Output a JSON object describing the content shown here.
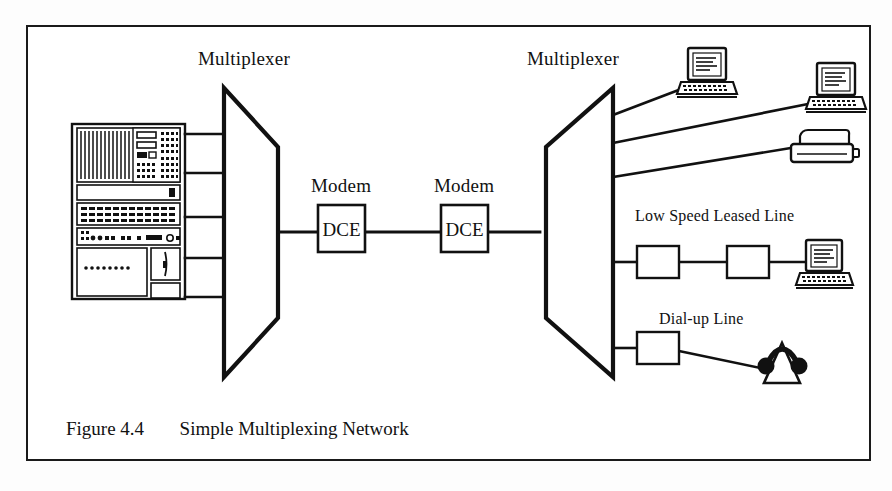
{
  "figure": {
    "caption_number": "Figure 4.4",
    "caption_title": "Simple Multiplexing Network",
    "frame_color": "#1a1a1a",
    "ink_color": "#111111",
    "background": "#ffffff"
  },
  "labels": {
    "multiplexer_left": "Multiplexer",
    "multiplexer_right": "Multiplexer",
    "modem_left": "Modem",
    "modem_right": "Modem",
    "leased_line": "Low Speed Leased Line",
    "dialup_line": "Dial-up Line"
  },
  "nodes": {
    "mainframe": {
      "name": "host-mainframe",
      "channel_count": 5
    },
    "mux_left": {
      "label": "Multiplexer",
      "inputs": 5,
      "outputs": 1
    },
    "mux_right": {
      "label": "Multiplexer",
      "inputs": 1,
      "outputs": 5
    },
    "modem_left": {
      "label": "Modem",
      "box_text": "DCE"
    },
    "modem_right": {
      "label": "Modem",
      "box_text": "DCE"
    },
    "terminal_top": {
      "type": "crt-terminal"
    },
    "terminal_second": {
      "type": "crt-terminal"
    },
    "printer": {
      "type": "printer"
    },
    "terminal_leased": {
      "type": "crt-terminal"
    },
    "acoustic_coupler": {
      "type": "acoustic-coupler"
    },
    "leased_modem_near": {
      "type": "modem-box",
      "box_text": ""
    },
    "leased_modem_far": {
      "type": "modem-box",
      "box_text": ""
    },
    "dialup_modem": {
      "type": "modem-box",
      "box_text": ""
    }
  },
  "links": [
    {
      "from": "mainframe",
      "to": "mux_left",
      "channel": 1
    },
    {
      "from": "mainframe",
      "to": "mux_left",
      "channel": 2
    },
    {
      "from": "mainframe",
      "to": "mux_left",
      "channel": 3
    },
    {
      "from": "mainframe",
      "to": "mux_left",
      "channel": 4
    },
    {
      "from": "mainframe",
      "to": "mux_left",
      "channel": 5
    },
    {
      "from": "mux_left",
      "to": "modem_left",
      "channel": 0
    },
    {
      "from": "modem_left",
      "to": "modem_right",
      "channel": 0
    },
    {
      "from": "modem_right",
      "to": "mux_right",
      "channel": 0
    },
    {
      "from": "mux_right",
      "to": "terminal_top",
      "channel": 1
    },
    {
      "from": "mux_right",
      "to": "terminal_second",
      "channel": 2
    },
    {
      "from": "mux_right",
      "to": "printer",
      "channel": 3
    },
    {
      "from": "mux_right",
      "to": "leased_modem_near",
      "channel": 4
    },
    {
      "from": "leased_modem_near",
      "to": "leased_modem_far",
      "channel": 4
    },
    {
      "from": "leased_modem_far",
      "to": "terminal_leased",
      "channel": 4
    },
    {
      "from": "mux_right",
      "to": "dialup_modem",
      "channel": 5
    },
    {
      "from": "dialup_modem",
      "to": "acoustic_coupler",
      "channel": 5
    }
  ]
}
